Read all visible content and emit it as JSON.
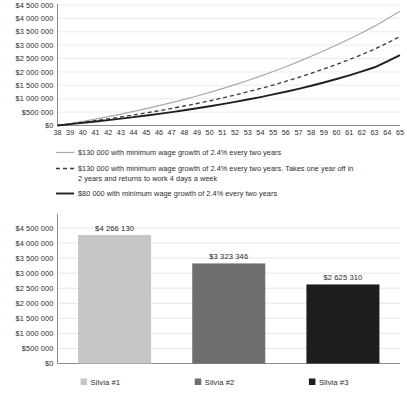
{
  "chart_data": [
    {
      "type": "line",
      "title": "",
      "xlabel": "",
      "ylabel": "",
      "grid": true,
      "legend_position": "below",
      "xlim": [
        38,
        65
      ],
      "ylim": [
        0,
        4500000
      ],
      "ytick_labels": [
        "$4 500 000",
        "$4 000 000",
        "$3 500 000",
        "$3 000 000",
        "$2 500 000",
        "$2 000 000",
        "$1 500 000",
        "$1 000 000",
        "$500 000",
        "$0"
      ],
      "ytick_values": [
        4500000,
        4000000,
        3500000,
        3000000,
        2500000,
        2000000,
        1500000,
        1000000,
        500000,
        0
      ],
      "x": [
        38,
        39,
        40,
        41,
        42,
        43,
        44,
        45,
        46,
        47,
        48,
        49,
        50,
        51,
        52,
        53,
        54,
        55,
        56,
        57,
        58,
        59,
        60,
        61,
        62,
        63,
        64,
        65
      ],
      "series": [
        {
          "name": "$130 000 with minimum wage growth of 2.4% every two years",
          "style": "solid-light",
          "color": "#a9a9a9",
          "values": [
            0,
            75000,
            155000,
            240000,
            330000,
            425000,
            525000,
            630000,
            740000,
            855000,
            975000,
            1100000,
            1235000,
            1375000,
            1525000,
            1680000,
            1845000,
            2015000,
            2195000,
            2385000,
            2585000,
            2790000,
            3005000,
            3230000,
            3465000,
            3710000,
            3985000,
            4266130
          ]
        },
        {
          "name": "$130 000 with minimum wage growth of 2.4% every two years. Takes one year off in 2 years and returns to work 4 days a week",
          "style": "dashed",
          "color": "#3a3a3a",
          "values": [
            0,
            62000,
            120000,
            182000,
            248000,
            318000,
            392000,
            470000,
            552000,
            638000,
            728000,
            822000,
            922000,
            1028000,
            1140000,
            1258000,
            1382000,
            1512000,
            1650000,
            1795000,
            1948000,
            2110000,
            2280000,
            2460000,
            2650000,
            2852000,
            3080000,
            3323346
          ]
        },
        {
          "name": "$80 000 with minimum wage growth of 2.4% every two years",
          "style": "solid-dark",
          "color": "#1f1f1f",
          "values": [
            0,
            50000,
            98000,
            148000,
            200000,
            255000,
            312000,
            372000,
            435000,
            500000,
            570000,
            642000,
            718000,
            798000,
            882000,
            970000,
            1062000,
            1160000,
            1262000,
            1370000,
            1485000,
            1605000,
            1735000,
            1872000,
            2018000,
            2175000,
            2392000,
            2625310
          ]
        }
      ]
    },
    {
      "type": "bar",
      "title": "",
      "xlabel": "",
      "ylabel": "",
      "grid": true,
      "legend_position": "below",
      "ylim": [
        0,
        4500000
      ],
      "ytick_labels": [
        "$4 500 000",
        "$4 000 000",
        "$3 500 000",
        "$3 000 000",
        "$2 500 000",
        "$2 000 000",
        "$1 500 000",
        "$1 000 000",
        "$500 000",
        "$0"
      ],
      "ytick_values": [
        4500000,
        4000000,
        3500000,
        3000000,
        2500000,
        2000000,
        1500000,
        1000000,
        500000,
        0
      ],
      "categories": [
        "Silvia #1",
        "Silvia #2",
        "Silvia #3"
      ],
      "values": [
        4266130,
        3323346,
        2625310
      ],
      "value_labels": [
        "$4 266 130",
        "$3 323 346",
        "$2 625 310"
      ],
      "colors": [
        "#c6c6c6",
        "#6e6e6e",
        "#1d1d1d"
      ]
    }
  ],
  "line_chart": {
    "ytick_labels": [
      "$4 500 000",
      "$4 000 000",
      "$3 500 000",
      "$3 000 000",
      "$2 500 000",
      "$2 000 000",
      "$1 500 000",
      "$1 000 000",
      "$500 000",
      "$0"
    ],
    "xtick_labels": [
      "38",
      "39",
      "40",
      "41",
      "42",
      "43",
      "44",
      "45",
      "46",
      "47",
      "48",
      "49",
      "50",
      "51",
      "52",
      "53",
      "54",
      "55",
      "56",
      "57",
      "58",
      "59",
      "60",
      "61",
      "62",
      "63",
      "64",
      "65"
    ],
    "legend": [
      {
        "label": "$130 000 with minimum wage growth of 2.4% every two years",
        "style": "solid-light"
      },
      {
        "label_line1": "$130 000 with minimum wage growth of 2.4% every two years. Takes one year off in",
        "label_line2": "2 years and returns to work 4 days a week",
        "style": "dashed"
      },
      {
        "label": "$80 000 with minimum wage growth of 2.4% every two years",
        "style": "solid-dark"
      }
    ]
  },
  "bar_chart": {
    "ytick_labels": [
      "$4 500 000",
      "$4 000 000",
      "$3 500 000",
      "$3 000 000",
      "$2 500 000",
      "$2 000 000",
      "$1 500 000",
      "$1 000 000",
      "$500 000",
      "$0"
    ],
    "bars": [
      {
        "label": "Silvia #1",
        "value_label": "$4 266 130",
        "color": "#c6c6c6"
      },
      {
        "label": "Silvia #2",
        "value_label": "$3 323 346",
        "color": "#6e6e6e"
      },
      {
        "label": "Silvia #3",
        "value_label": "$2 625 310",
        "color": "#1d1d1d"
      }
    ]
  },
  "colors": {
    "series_light": "#a9a9a9",
    "series_dash": "#3a3a3a",
    "series_dark": "#1f1f1f",
    "axis": "#8c8c8c",
    "grid": "#ececec",
    "text": "#2b2b2b"
  }
}
